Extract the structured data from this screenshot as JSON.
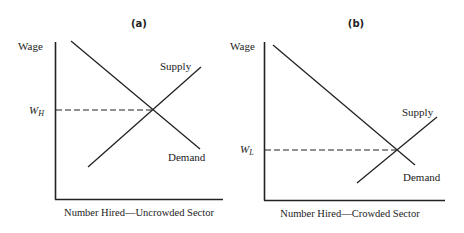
{
  "panels": [
    {
      "id": "a",
      "title": "(a)",
      "y_axis_label": "Wage",
      "x_axis_label": "Number Hired—Uncrowded Sector",
      "wage_label_main": "W",
      "wage_label_sub": "H",
      "supply_label": "Supply",
      "demand_label": "Demand"
    },
    {
      "id": "b",
      "title": "(b)",
      "y_axis_label": "Wage",
      "x_axis_label": "Number Hired—Crowded Sector",
      "wage_label_main": "W",
      "wage_label_sub": "L",
      "supply_label": "Supply",
      "demand_label": "Demand"
    }
  ],
  "colors": {
    "line": "#222222",
    "background": "#ffffff"
  }
}
